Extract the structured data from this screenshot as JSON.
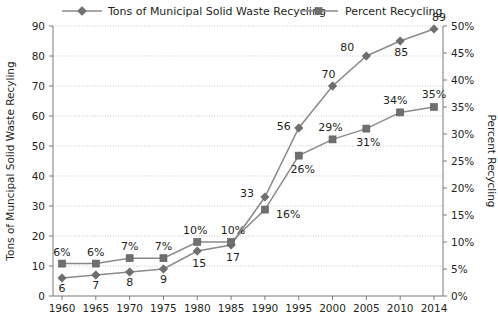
{
  "chart_data": {
    "type": "line",
    "title": "",
    "categories": [
      "1960",
      "1965",
      "1970",
      "1975",
      "1980",
      "1985",
      "1990",
      "1995",
      "2000",
      "2005",
      "2010",
      "2014"
    ],
    "x": [
      1960,
      1965,
      1970,
      1975,
      1980,
      1985,
      1990,
      1995,
      2000,
      2005,
      2010,
      2014
    ],
    "series": [
      {
        "name": "Tons of Municipal Solid Waste Recycling",
        "axis": "left",
        "marker": "diamond",
        "color": "#6f6f6f",
        "values": [
          6,
          7,
          8,
          9,
          15,
          17,
          33,
          56,
          70,
          80,
          85,
          89
        ],
        "labels": [
          "6",
          "7",
          "8",
          "9",
          "15",
          "17",
          "33",
          "56",
          "70",
          "80",
          "85",
          "89"
        ]
      },
      {
        "name": "Percent Recycling",
        "axis": "right",
        "marker": "square",
        "color": "#8c8c8c",
        "values": [
          6,
          6,
          7,
          7,
          10,
          10,
          16,
          26,
          29,
          31,
          34,
          35
        ],
        "labels": [
          "6%",
          "6%",
          "7%",
          "7%",
          "10%",
          "10%",
          "16%",
          "26%",
          "29%",
          "31%",
          "34%",
          "35%"
        ]
      }
    ],
    "xlabel": "",
    "ylabel": "Tons of Muncipal Solid Waste Recyling",
    "y2label": "Percent Recycling",
    "ylim": [
      0,
      90
    ],
    "y2lim": [
      0,
      50
    ],
    "yticks": [
      "0",
      "10",
      "20",
      "30",
      "40",
      "50",
      "60",
      "70",
      "80",
      "90"
    ],
    "ytick_values": [
      0,
      10,
      20,
      30,
      40,
      50,
      60,
      70,
      80,
      90
    ],
    "y2ticks": [
      "0%",
      "5%",
      "10%",
      "15%",
      "20%",
      "25%",
      "30%",
      "35%",
      "40%",
      "45%",
      "50%"
    ],
    "y2tick_values": [
      0,
      5,
      10,
      15,
      20,
      25,
      30,
      35,
      40,
      45,
      50
    ],
    "xticks": [
      "1960",
      "1965",
      "1970",
      "1975",
      "1980",
      "1985",
      "1990",
      "1995",
      "2000",
      "2005",
      "2010",
      "2014"
    ],
    "grid": true,
    "legend_position": "top"
  },
  "legend": {
    "items": [
      {
        "label": "Tons of Municipal Solid Waste Recycling",
        "marker": "diamond"
      },
      {
        "label": "Percent Recycling",
        "marker": "square"
      }
    ]
  },
  "axes": {
    "left_title": "Tons of Muncipal Solid Waste Recyling",
    "right_title": "Percent Recycling"
  }
}
